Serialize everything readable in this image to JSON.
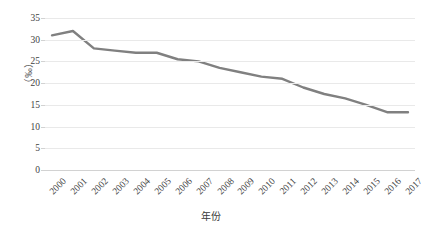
{
  "chart_data": {
    "type": "line",
    "title": "",
    "xlabel": "年份",
    "ylabel": "（‰）",
    "categories": [
      "2000",
      "2001",
      "2002",
      "2003",
      "2004",
      "2005",
      "2006",
      "2007",
      "2008",
      "2009",
      "2010",
      "2011",
      "2012",
      "2013",
      "2014",
      "2015",
      "2016",
      "2017"
    ],
    "values": [
      31.0,
      32.0,
      28.0,
      27.5,
      27.0,
      27.0,
      25.5,
      25.0,
      23.5,
      22.5,
      21.5,
      21.0,
      19.0,
      17.5,
      16.5,
      15.0,
      13.3,
      13.3
    ],
    "series": [
      {
        "name": "",
        "values": [
          31.0,
          32.0,
          28.0,
          27.5,
          27.0,
          27.0,
          25.5,
          25.0,
          23.5,
          22.5,
          21.5,
          21.0,
          19.0,
          17.5,
          16.5,
          15.0,
          13.3,
          13.3
        ]
      }
    ],
    "ylim": [
      0,
      35
    ],
    "y_ticks": [
      0,
      5,
      10,
      15,
      20,
      25,
      30,
      35
    ],
    "y_tick_labels": [
      "0",
      "5",
      "10",
      "15",
      "20",
      "25",
      "30",
      "35"
    ],
    "grid": true,
    "grid_axis": "y",
    "legend": "none",
    "markers": false,
    "line_color": "#808080",
    "grid_color": "#e9e9e9",
    "axis_color": "#d2d2d2",
    "text_color": "#3f3f3f",
    "x_tick_rotation": -45,
    "background": "#ffffff"
  }
}
